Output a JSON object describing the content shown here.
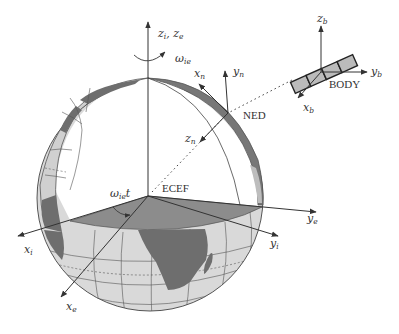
{
  "figure": {
    "colors": {
      "ocean": "#d9d9d9",
      "land": "#777777",
      "grid": "#555555",
      "axis": "#333333",
      "plane": "#8c8c8c",
      "background": "#ffffff"
    }
  },
  "frames": {
    "ecef": {
      "label": "ECEF"
    },
    "ned": {
      "label": "NED"
    },
    "body": {
      "label": "BODY"
    }
  },
  "axes": {
    "z_ie": {
      "main": "z",
      "sub1": "i",
      "sep": ", ",
      "main2": "z",
      "sub2": "e"
    },
    "x_i": {
      "main": "x",
      "sub": "i"
    },
    "x_e": {
      "main": "x",
      "sub": "e"
    },
    "y_i": {
      "main": "y",
      "sub": "i"
    },
    "y_e": {
      "main": "y",
      "sub": "e"
    },
    "x_n": {
      "main": "x",
      "sub": "n"
    },
    "y_n": {
      "main": "y",
      "sub": "n"
    },
    "z_n": {
      "main": "z",
      "sub": "n"
    },
    "x_b": {
      "main": "x",
      "sub": "b"
    },
    "y_b": {
      "main": "y",
      "sub": "b"
    },
    "z_b": {
      "main": "z",
      "sub": "b"
    }
  },
  "rotation": {
    "omega": {
      "main": "ω",
      "sub": "ie"
    },
    "angle": {
      "main": "ω",
      "sub": "ie",
      "suffix": "t"
    }
  }
}
